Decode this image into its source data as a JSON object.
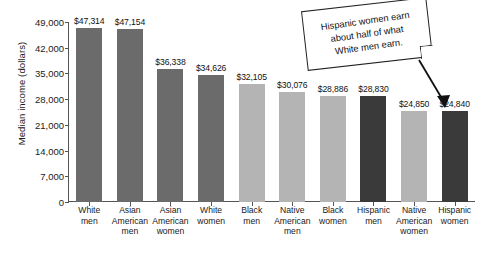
{
  "chart_data": {
    "type": "bar",
    "title": "",
    "xlabel": "",
    "ylabel": "Median income (dollars)",
    "ylim": [
      0,
      49000
    ],
    "ytick_labels": [
      "49,000",
      "42,000",
      "35,000",
      "28,000",
      "21,000",
      "14,000",
      "7,000",
      "0"
    ],
    "yticks": [
      49000,
      42000,
      35000,
      28000,
      21000,
      14000,
      7000,
      0
    ],
    "grid": false,
    "legend": "none",
    "categories": [
      "White men",
      "Asian American men",
      "Asian American women",
      "White women",
      "Black men",
      "Native American men",
      "Black women",
      "Hispanic men",
      "Native American women",
      "Hispanic women"
    ],
    "category_lines": [
      [
        "White",
        "men"
      ],
      [
        "Asian",
        "American",
        "men"
      ],
      [
        "Asian",
        "American",
        "women"
      ],
      [
        "White",
        "women"
      ],
      [
        "Black",
        "men"
      ],
      [
        "Native",
        "American",
        "men"
      ],
      [
        "Black",
        "women"
      ],
      [
        "Hispanic",
        "men"
      ],
      [
        "Native",
        "American",
        "women"
      ],
      [
        "Hispanic",
        "women"
      ]
    ],
    "values": [
      47314,
      47154,
      36338,
      34626,
      32105,
      30076,
      28886,
      28830,
      24850,
      24840
    ],
    "value_labels": [
      "$47,314",
      "$47,154",
      "$36,338",
      "$34,626",
      "$32,105",
      "$30,076",
      "$28,886",
      "$28,830",
      "$24,850",
      "$24,840"
    ],
    "bar_colors": [
      "#6b6b6b",
      "#6b6b6b",
      "#6b6b6b",
      "#6b6b6b",
      "#b4b4b4",
      "#b4b4b4",
      "#b4b4b4",
      "#3a3a3a",
      "#b4b4b4",
      "#3a3a3a"
    ]
  },
  "annotation": {
    "lines": [
      "Hispanic women earn",
      "about half of what",
      "White men earn."
    ],
    "text": "Hispanic women earn about half of what White men earn."
  },
  "source_note": {
    "text": ""
  },
  "colors": {
    "axis": "#555555",
    "text": "#1a1a1a",
    "bar_medium": "#6b6b6b",
    "bar_light": "#b4b4b4",
    "bar_dark": "#3a3a3a",
    "background": "#ffffff"
  }
}
